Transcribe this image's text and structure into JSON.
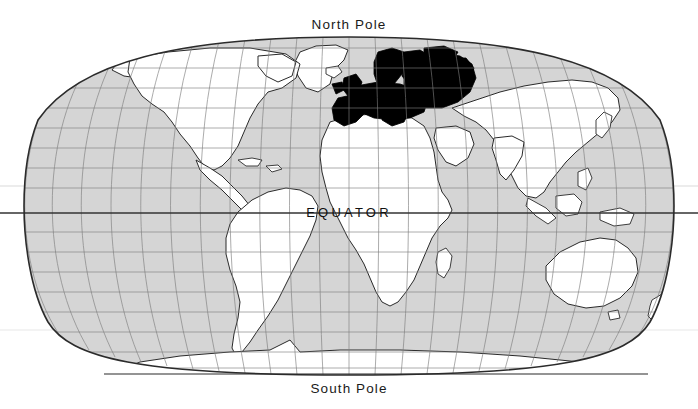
{
  "map": {
    "projection": "robinson",
    "title_top": "North Pole",
    "title_bottom": "South Pole",
    "equator_label": "EQUATOR",
    "highlight_region": "Europe",
    "colors": {
      "background": "#ffffff",
      "ocean": "#d5d5d5",
      "land": "#ffffff",
      "graticule": "#7d7d7d",
      "outline": "#2b2b2b",
      "highlight": "#000000",
      "equator_line": "#333333",
      "tropic_line": "#e2e2e2",
      "text": "#1a1a1a"
    },
    "graticule": {
      "meridian_step_deg": 15,
      "parallel_step_deg": 10,
      "visible": true
    },
    "lines": {
      "equator_y": 213,
      "tropic_north_y": 186,
      "tropic_south_y": 330
    },
    "extent": {
      "left": 33,
      "right": 665,
      "top": 37,
      "bottom": 375
    }
  }
}
